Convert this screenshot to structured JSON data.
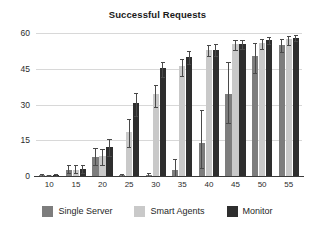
{
  "chart_data": {
    "type": "bar",
    "title": "Successful Requests",
    "xlabel": "",
    "ylabel": "",
    "categories": [
      "10",
      "15",
      "20",
      "25",
      "30",
      "35",
      "40",
      "45",
      "50",
      "55"
    ],
    "ylim": [
      0,
      60
    ],
    "yticks": [
      0,
      15,
      30,
      45,
      60
    ],
    "ytick_labels": [
      "0",
      "15",
      "30",
      "45",
      "60"
    ],
    "grid": true,
    "legend_position": "bottom",
    "series": [
      {
        "name": "Single Server",
        "color": "#7d7d7d",
        "values": [
          0.4,
          2.6,
          7.8,
          0.5,
          0.6,
          2.6,
          14.0,
          34.3,
          50.2,
          55.0
        ],
        "err_low": [
          0.4,
          1.3,
          3.3,
          0.5,
          0.6,
          2.6,
          10.5,
          12.0,
          6.8,
          2.8
        ],
        "err_high": [
          0.4,
          2.2,
          4.0,
          0.5,
          0.6,
          4.6,
          13.5,
          13.5,
          5.5,
          2.5
        ]
      },
      {
        "name": "Smart Agents",
        "color": "#c9c9c9",
        "values": [
          0.3,
          2.6,
          8.3,
          18.3,
          34.3,
          46.0,
          52.8,
          55.2,
          56.0,
          57.5
        ],
        "err_low": [
          0.3,
          1.5,
          3.5,
          6.3,
          5.3,
          4.0,
          2.5,
          2.2,
          2.8,
          2.5
        ],
        "err_high": [
          0.3,
          2.2,
          3.2,
          5.5,
          4.0,
          3.0,
          2.2,
          2.0,
          1.6,
          1.2
        ]
      },
      {
        "name": "Monitor",
        "color": "#2e2e2e",
        "values": [
          0.4,
          2.8,
          12.3,
          30.5,
          45.2,
          49.8,
          53.0,
          55.3,
          57.0,
          58.0
        ],
        "err_low": [
          0.4,
          1.6,
          4.0,
          5.5,
          3.5,
          2.8,
          2.5,
          2.0,
          1.5,
          1.3
        ],
        "err_high": [
          0.4,
          2.0,
          3.2,
          4.5,
          2.5,
          2.5,
          2.2,
          1.8,
          1.2,
          1.0
        ]
      }
    ]
  }
}
